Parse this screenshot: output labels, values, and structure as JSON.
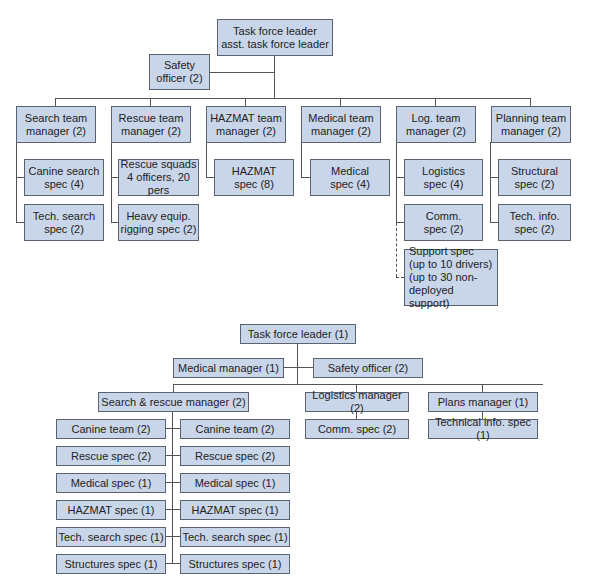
{
  "top_chart": {
    "leader": "Task force leader\nasst. task force leader",
    "safety_officer": "Safety\nofficer (2)",
    "managers": [
      {
        "label": "Search team\nmanager (2)",
        "specs": [
          "Canine search\nspec (4)",
          "Tech. search\nspec (2)"
        ]
      },
      {
        "label": "Rescue team\nmanager (2)",
        "specs": [
          "Rescue squads\n4 officers, 20 pers",
          "Heavy equip.\nrigging spec (2)"
        ]
      },
      {
        "label": "HAZMAT team\nmanager (2)",
        "specs": [
          "HAZMAT\nspec (8)"
        ]
      },
      {
        "label": "Medical team\nmanager (2)",
        "specs": [
          "Medical\nspec (4)"
        ]
      },
      {
        "label": "Log. team\nmanager (2)",
        "specs": [
          "Logistics\nspec (4)",
          "Comm.\nspec (2)"
        ],
        "dashed_spec": "Support spec\n(up to 10 drivers)\n(up to 30 non-\ndeployed support)"
      },
      {
        "label": "Planning team\nmanager (2)",
        "specs": [
          "Structural\nspec (2)",
          "Tech. info.\nspec (2)"
        ]
      }
    ]
  },
  "bottom_chart": {
    "leader": "Task force leader (1)",
    "medical_manager": "Medical manager (1)",
    "safety_officer": "Safety officer (2)",
    "search_rescue_manager": "Search & rescue manager (2)",
    "logistics_manager": "Logistics manager (2)",
    "plans_manager": "Plans manager (1)",
    "comm_spec": "Comm. spec (2)",
    "technical_info_spec": "Technical info. spec (1)",
    "sr_left": [
      "Canine team (2)",
      "Rescue spec (2)",
      "Medical spec (1)",
      "HAZMAT spec (1)",
      "Tech. search spec (1)",
      "Structures spec (1)"
    ],
    "sr_right": [
      "Canine team (2)",
      "Rescue spec (2)",
      "Medical spec (1)",
      "HAZMAT spec (1)",
      "Tech. search spec (1)",
      "Structures spec (1)"
    ]
  },
  "colors": {
    "box_fill": "#c9d6ea",
    "box_border": "#5a6470",
    "line": "#555555"
  }
}
